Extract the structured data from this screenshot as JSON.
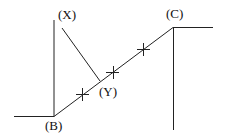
{
  "diagram": {
    "labels": {
      "x": "(X)",
      "c": "(C)",
      "y": "(Y)",
      "b": "(B)"
    },
    "colors": {
      "line": "#222222",
      "text": "#111111",
      "background": "#ffffff"
    }
  }
}
